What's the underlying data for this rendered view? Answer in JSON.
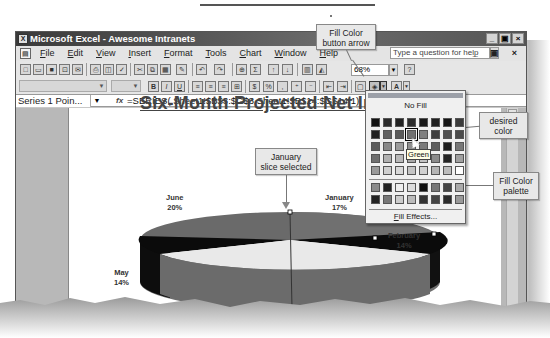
{
  "window": {
    "title": "Microsoft Excel - Awesome Intranets",
    "controls": [
      "_",
      "▣",
      "×"
    ]
  },
  "menubar": {
    "items": [
      "File",
      "Edit",
      "View",
      "Insert",
      "Format",
      "Tools",
      "Chart",
      "Window",
      "Help"
    ],
    "help_placeholder": "Type a question for help",
    "mdi_controls": "_ ▣ ×"
  },
  "toolbar": {
    "zoom_value": "68%",
    "help_icon": "?"
  },
  "formula_bar": {
    "name_box": "Series 1 Poin...",
    "fx_label": "fx",
    "formula": "=SERIES(,Sheet1!$B$3:$G$3,Sheet1!$B$14:$G$14,1)"
  },
  "palette": {
    "no_fill_label": "No Fill",
    "fill_effects_label": "Fill Effects...",
    "hover_tooltip": "Green",
    "main_colors": [
      "#111111",
      "#2a2a2a",
      "#222222",
      "#2b2b2b",
      "#1a1a1a",
      "#202020",
      "#151515",
      "#3a3a3a",
      "#222222",
      "#606060",
      "#5a5a5a",
      "#707070",
      "#808080",
      "#3f3f3f",
      "#505050",
      "#4a4a4a",
      "#5b5b5b",
      "#8a8a8a",
      "#9b9b9b",
      "#8f8f8f",
      "#7a7a7a",
      "#5f5f5f",
      "#1c1c1c",
      "#777777",
      "#6f6f6f",
      "#b0b0b0",
      "#b8b8b8",
      "#a8a8a8",
      "#c2c2c2",
      "#8c8c8c",
      "#242424",
      "#a0a0a0",
      "#999999",
      "#cfcfcf",
      "#d9d9d9",
      "#c4c4c4",
      "#d0d0d0",
      "#b5b5b5",
      "#bcbcbc",
      "#ffffff"
    ],
    "chart_colors": [
      "#8a8a8a",
      "#222222",
      "#eeeeee",
      "#dddddd",
      "#111111",
      "#777777",
      "#444444",
      "#aaaaaa",
      "#222222",
      "#777777",
      "#cccccc",
      "#bbbbbb",
      "#333333",
      "#444444",
      "#2a2a2a",
      "#999999"
    ],
    "selected_index": 11
  },
  "callouts": {
    "fill_color_button": "Fill Color\nbutton arrow",
    "desired_color": "desired\ncolor",
    "fill_color_palette": "Fill Color\npalette",
    "january_slice": "January\nslice selected"
  },
  "chart_data": {
    "type": "pie",
    "title": "Six-Month Projected Net Income",
    "categories": [
      "January",
      "February",
      "March",
      "April",
      "May",
      "June"
    ],
    "values": [
      17,
      14,
      null,
      null,
      14,
      20
    ],
    "labels": [
      {
        "name": "January",
        "percent": "17%"
      },
      {
        "name": "February",
        "percent": "14%"
      },
      {
        "name": "March",
        "percent": ""
      },
      {
        "name": "April",
        "percent": ""
      },
      {
        "name": "May",
        "percent": "14%"
      },
      {
        "name": "June",
        "percent": "20%"
      }
    ],
    "selected_slice": "January",
    "three_d": true
  }
}
